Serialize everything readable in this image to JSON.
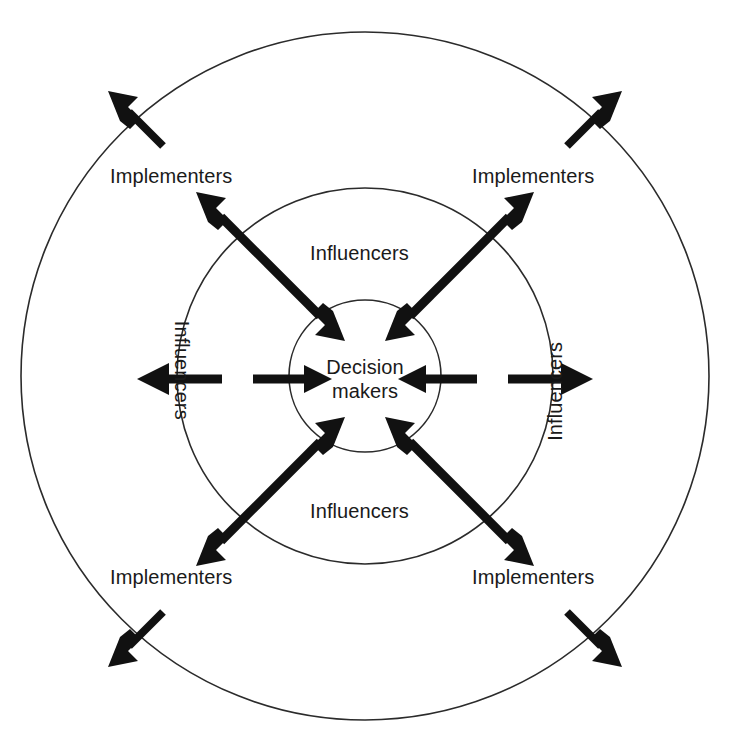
{
  "diagram": {
    "type": "concentric-circles-influence-model",
    "background_color": "#ffffff",
    "line_color": "#111111",
    "ring_stroke_color": "#2b2b2b",
    "center": {
      "label": "Decision makers",
      "line1": "Decision",
      "line2": "makers"
    },
    "rings": [
      {
        "name": "inner-ring",
        "radius_px": 76
      },
      {
        "name": "middle-ring",
        "radius_px": 188
      },
      {
        "name": "outer-ring",
        "radius_px": 344
      }
    ],
    "labels": {
      "influencer_top": "Influencers",
      "influencer_bottom": "Influencers",
      "influencer_left": "Influencers",
      "influencer_right": "Influencers",
      "implementer_top_left": "Implementers",
      "implementer_top_right": "Implementers",
      "implementer_bottom_left": "Implementers",
      "implementer_bottom_right": "Implementers"
    },
    "arrows": {
      "inward_left": "arrow pointing right into Decision makers",
      "inward_right": "arrow pointing left into Decision makers",
      "outward_left": "arrow pointing left out of middle ring",
      "outward_right": "arrow pointing right out of middle ring",
      "diagonal_top_left": "double headed arrow",
      "diagonal_top_right": "double headed arrow",
      "diagonal_bottom_left": "double headed arrow",
      "diagonal_bottom_right": "double headed arrow",
      "edge_top_left": "arrow pointing up-left across outer ring",
      "edge_top_right": "arrow pointing up-right across outer ring",
      "edge_bottom_left": "arrow pointing down-left across outer ring",
      "edge_bottom_right": "arrow pointing down-right across outer ring"
    }
  }
}
